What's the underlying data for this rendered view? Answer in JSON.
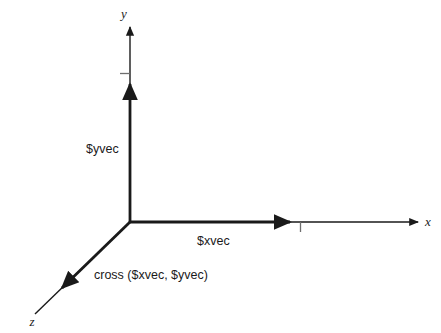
{
  "figure": {
    "background_color": "#ffffff",
    "line_color": "#1a1a1a",
    "tick_color": "#6e6e6e",
    "width": 441,
    "height": 333
  },
  "axes": [
    {
      "id": "y",
      "label": "y",
      "direction": "up"
    },
    {
      "id": "x",
      "label": "x",
      "direction": "right"
    },
    {
      "id": "z",
      "label": "z",
      "direction": "down-left"
    }
  ],
  "axis_labels": {
    "y": "y",
    "x": "x",
    "z": "z"
  },
  "vectors": [
    {
      "id": "yvec",
      "label": "$yvec",
      "axis": "y"
    },
    {
      "id": "xvec",
      "label": "$xvec",
      "axis": "x"
    },
    {
      "id": "zvec",
      "label": "cross ($xvec, $yvec)",
      "axis": "z"
    }
  ],
  "vector_labels": {
    "yvec": "$yvec",
    "xvec": "$xvec",
    "cross": "cross ($xvec, $yvec)"
  },
  "ticks": [
    {
      "axis": "y",
      "side": "left"
    },
    {
      "axis": "x",
      "side": "below"
    }
  ]
}
